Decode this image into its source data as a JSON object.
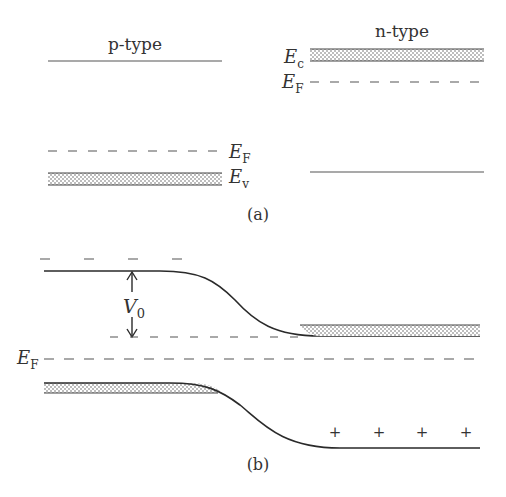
{
  "panel_a": {
    "caption": "(a)",
    "p_side": {
      "title": "p-type",
      "fermi_label": "E",
      "fermi_sub": "F",
      "valence_label": "E",
      "valence_sub": "v"
    },
    "n_side": {
      "title": "n-type",
      "conduction_label": "E",
      "conduction_sub": "c",
      "fermi_label": "E",
      "fermi_sub": "F"
    }
  },
  "panel_b": {
    "caption": "(b)",
    "barrier_label": "V",
    "barrier_sub": "0",
    "fermi_label": "E",
    "fermi_sub": "F",
    "charge_symbols": [
      "+",
      "+",
      "+",
      "+"
    ],
    "top_dash_symbols": [
      "–",
      "–",
      "–",
      "–"
    ]
  },
  "colors": {
    "line": "#2a2a2a",
    "dash": "#555555",
    "stipple": "#6a6a6a",
    "text": "#333333"
  }
}
